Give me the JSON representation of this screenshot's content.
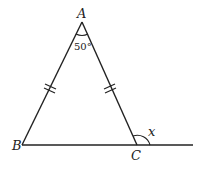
{
  "diagram": {
    "type": "isosceles-triangle-exterior-angle",
    "vertices": {
      "A": {
        "label": "A",
        "x": 82,
        "y": 22
      },
      "B": {
        "label": "B",
        "x": 22,
        "y": 145
      },
      "C": {
        "label": "C",
        "x": 137,
        "y": 145
      }
    },
    "extended_line_end": {
      "x": 193,
      "y": 145
    },
    "angle_A": {
      "label": "50°"
    },
    "exterior_angle_C": {
      "label": "x"
    },
    "equal_sides": [
      "AB",
      "AC"
    ],
    "tick_marks_per_side": 2,
    "stroke_color": "#222222"
  }
}
